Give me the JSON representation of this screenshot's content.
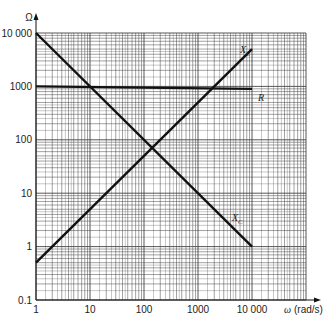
{
  "chart_data": {
    "type": "line",
    "title": "",
    "xlabel": "ω (rad/s)",
    "ylabel": "Ω",
    "xscale": "log",
    "yscale": "log",
    "xlim": [
      1,
      100000
    ],
    "ylim": [
      0.1,
      10000
    ],
    "grid": true,
    "x_tick_labels": [
      "1",
      "10",
      "100",
      "1000",
      "10 000"
    ],
    "y_tick_labels": [
      "0.1",
      "1",
      "10",
      "100",
      "1000",
      "10 000"
    ],
    "series": [
      {
        "name": "X_L",
        "label": "XL",
        "x": [
          1,
          10000
        ],
        "y": [
          0.5,
          5000
        ]
      },
      {
        "name": "X_C",
        "label": "XC",
        "x": [
          1,
          10000
        ],
        "y": [
          10000,
          1
        ]
      },
      {
        "name": "R",
        "label": "R",
        "x": [
          1,
          10000
        ],
        "y": [
          1000,
          1000
        ]
      }
    ],
    "annotations": [
      "X_L",
      "X_C",
      "R"
    ]
  },
  "axes": {
    "x_label_symbol": "ω",
    "x_label_unit": "(rad/s)",
    "y_label": "Ω"
  },
  "colors": {
    "line": "#111111",
    "grid": "#444444",
    "bg": "#ffffff"
  }
}
